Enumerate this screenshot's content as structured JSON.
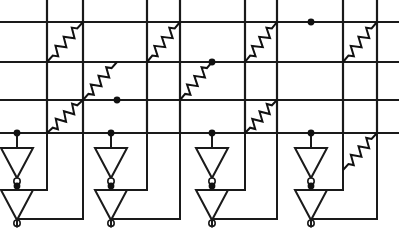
{
  "figure": {
    "type": "circuit-schematic",
    "width": 399,
    "height": 231,
    "background_color": "#ffffff",
    "line_color": "#1a1a1a",
    "node_color": "#111111"
  },
  "geometry": {
    "horizontal_lines": [
      {
        "name": "row-line-1",
        "y": 22,
        "x1": 0,
        "x2": 399
      },
      {
        "name": "row-line-2",
        "y": 62,
        "x1": 0,
        "x2": 399
      },
      {
        "name": "row-line-3",
        "y": 100,
        "x1": 0,
        "x2": 399
      },
      {
        "name": "row-line-4",
        "y": 133,
        "x1": 0,
        "x2": 399
      }
    ],
    "vertical_lines": [
      {
        "name": "col-line-1",
        "x": 47,
        "y1": 0,
        "y2": 133
      },
      {
        "name": "col-line-2",
        "x": 83,
        "y1": 0,
        "y2": 133
      },
      {
        "name": "col-line-3",
        "x": 147,
        "y1": 0,
        "y2": 133
      },
      {
        "name": "col-line-4",
        "x": 180,
        "y1": 0,
        "y2": 133
      },
      {
        "name": "col-line-5",
        "x": 245,
        "y1": 0,
        "y2": 133
      },
      {
        "name": "col-line-6",
        "x": 277,
        "y1": 0,
        "y2": 133
      },
      {
        "name": "col-line-7",
        "x": 343,
        "y1": 0,
        "y2": 133
      },
      {
        "name": "col-line-8",
        "x": 377,
        "y1": 0,
        "y2": 133
      }
    ],
    "resistors": [
      {
        "name": "resistor-r1c1",
        "x1": 47,
        "y1": 62,
        "x2": 83,
        "y2": 22
      },
      {
        "name": "resistor-r1c3",
        "x1": 147,
        "y1": 62,
        "x2": 180,
        "y2": 22
      },
      {
        "name": "resistor-r1c5",
        "x1": 245,
        "y1": 62,
        "x2": 277,
        "y2": 22
      },
      {
        "name": "resistor-r1c7",
        "x1": 343,
        "y1": 62,
        "x2": 377,
        "y2": 22
      },
      {
        "name": "resistor-r2c2",
        "x1": 83,
        "y1": 100,
        "x2": 117,
        "y2": 62
      },
      {
        "name": "resistor-r2c4",
        "x1": 180,
        "y1": 100,
        "x2": 212,
        "y2": 62
      },
      {
        "name": "resistor-r3c1",
        "x1": 47,
        "y1": 133,
        "x2": 83,
        "y2": 100
      },
      {
        "name": "resistor-r3c5",
        "x1": 245,
        "y1": 133,
        "x2": 277,
        "y2": 100
      },
      {
        "name": "resistor-r4c7",
        "x1": 343,
        "y1": 170,
        "x2": 377,
        "y2": 133
      }
    ],
    "junction_dots": [
      {
        "name": "junction-dot-a",
        "x": 117,
        "y": 100
      },
      {
        "name": "junction-dot-b",
        "x": 212,
        "y": 62
      },
      {
        "name": "junction-dot-c",
        "x": 311,
        "y": 22
      },
      {
        "name": "junction-dot-in-1",
        "x": 17,
        "y": 133
      },
      {
        "name": "junction-dot-in-2",
        "x": 111,
        "y": 133
      },
      {
        "name": "junction-dot-in-3",
        "x": 212,
        "y": 133
      },
      {
        "name": "junction-dot-in-4",
        "x": 311,
        "y": 133
      },
      {
        "name": "junction-dot-mid-1",
        "x": 17,
        "y": 186
      },
      {
        "name": "junction-dot-mid-2",
        "x": 111,
        "y": 186
      },
      {
        "name": "junction-dot-mid-3",
        "x": 212,
        "y": 186
      },
      {
        "name": "junction-dot-mid-4",
        "x": 311,
        "y": 186
      }
    ],
    "inverter_cells": [
      {
        "name": "inverter-cell-1",
        "input_x": 17,
        "top_inverter": {
          "name": "inverter-top-1",
          "cx": 17,
          "top_y": 148,
          "tip_y": 178,
          "half_w": 16
        },
        "bottom_inverter": {
          "name": "inverter-bottom-1",
          "cx": 17,
          "top_y": 190,
          "tip_y": 220,
          "half_w": 16
        },
        "feedback_up_x": 47,
        "feedback_down_x": 83
      },
      {
        "name": "inverter-cell-2",
        "input_x": 111,
        "top_inverter": {
          "name": "inverter-top-2",
          "cx": 111,
          "top_y": 148,
          "tip_y": 178,
          "half_w": 16
        },
        "bottom_inverter": {
          "name": "inverter-bottom-2",
          "cx": 111,
          "top_y": 190,
          "tip_y": 220,
          "half_w": 16
        },
        "feedback_up_x": 147,
        "feedback_down_x": 180
      },
      {
        "name": "inverter-cell-3",
        "input_x": 212,
        "top_inverter": {
          "name": "inverter-top-3",
          "cx": 212,
          "top_y": 148,
          "tip_y": 178,
          "half_w": 16
        },
        "bottom_inverter": {
          "name": "inverter-bottom-3",
          "cx": 212,
          "top_y": 190,
          "tip_y": 220,
          "half_w": 16
        },
        "feedback_up_x": 245,
        "feedback_down_x": 277
      },
      {
        "name": "inverter-cell-4",
        "input_x": 311,
        "top_inverter": {
          "name": "inverter-top-4",
          "cx": 311,
          "top_y": 148,
          "tip_y": 178,
          "half_w": 16
        },
        "bottom_inverter": {
          "name": "inverter-bottom-4",
          "cx": 311,
          "top_y": 190,
          "tip_y": 220,
          "half_w": 16
        },
        "feedback_up_x": 343,
        "feedback_down_x": 377
      }
    ]
  },
  "labels": {
    "none_visible": ""
  }
}
